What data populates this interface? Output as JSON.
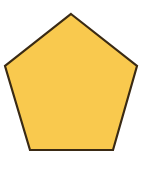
{
  "shape": {
    "type": "pentagon",
    "sides": 5,
    "fill_color": "#F9C94E",
    "stroke_color": "#3A2A14",
    "stroke_width": 2.2,
    "points": "71,14 137,66 113,150 30,150 5,66"
  },
  "background_color": "#FFFFFF"
}
